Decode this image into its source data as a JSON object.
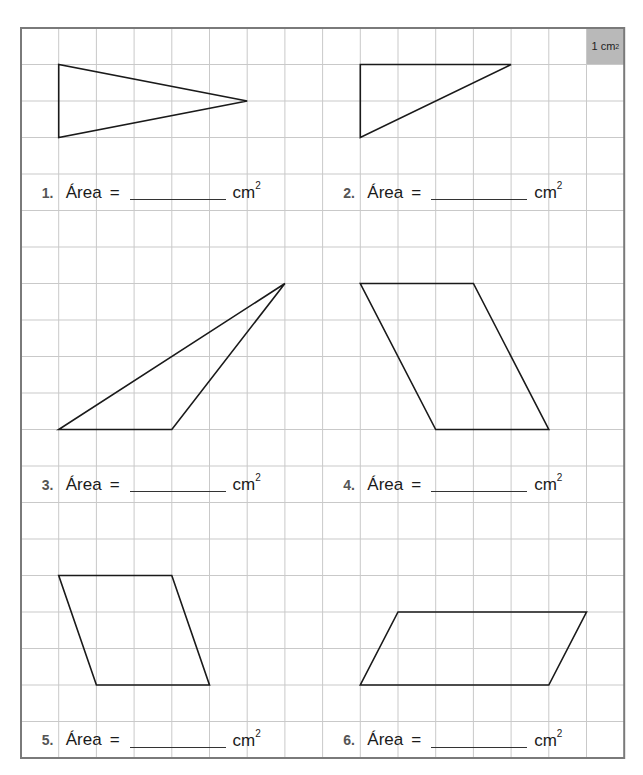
{
  "worksheet": {
    "unit_legend": {
      "value": "1",
      "unit": "cm",
      "exponent": "2",
      "fill": "#b9b9b9"
    },
    "grid": {
      "origin_x": 21,
      "origin_y": 28,
      "cols": 16,
      "rows": 20,
      "cell_w": 37.7,
      "cell_h": 36.5,
      "line_color": "#c9c9c9",
      "border_color": "#7a7a7a",
      "shape_color": "#1a1a1a"
    },
    "problems": [
      {
        "number": "1.",
        "word": "Área",
        "equals": "=",
        "unit": "cm",
        "exponent": "2",
        "label_col": 0.55,
        "label_row": 4,
        "shape": "triangle",
        "points": [
          [
            1,
            1
          ],
          [
            1,
            3
          ],
          [
            6,
            2
          ]
        ]
      },
      {
        "number": "2.",
        "word": "Área",
        "equals": "=",
        "unit": "cm",
        "exponent": "2",
        "label_col": 8.55,
        "label_row": 4,
        "shape": "triangle",
        "points": [
          [
            9,
            1
          ],
          [
            13,
            1
          ],
          [
            9,
            3
          ]
        ]
      },
      {
        "number": "3.",
        "word": "Área",
        "equals": "=",
        "unit": "cm",
        "exponent": "2",
        "label_col": 0.55,
        "label_row": 12,
        "shape": "triangle",
        "points": [
          [
            1,
            11
          ],
          [
            4,
            11
          ],
          [
            7,
            7
          ]
        ]
      },
      {
        "number": "4.",
        "word": "Área",
        "equals": "=",
        "unit": "cm",
        "exponent": "2",
        "label_col": 8.55,
        "label_row": 12,
        "shape": "parallelogram",
        "points": [
          [
            9,
            7
          ],
          [
            12,
            7
          ],
          [
            14,
            11
          ],
          [
            11,
            11
          ]
        ]
      },
      {
        "number": "5.",
        "word": "Área",
        "equals": "=",
        "unit": "cm",
        "exponent": "2",
        "label_col": 0.55,
        "label_row": 19,
        "shape": "parallelogram",
        "points": [
          [
            1,
            15
          ],
          [
            4,
            15
          ],
          [
            5,
            18
          ],
          [
            2,
            18
          ]
        ]
      },
      {
        "number": "6.",
        "word": "Área",
        "equals": "=",
        "unit": "cm",
        "exponent": "2",
        "label_col": 8.55,
        "label_row": 19,
        "shape": "parallelogram",
        "points": [
          [
            10,
            16
          ],
          [
            15,
            16
          ],
          [
            14,
            18
          ],
          [
            9,
            18
          ]
        ]
      }
    ]
  }
}
